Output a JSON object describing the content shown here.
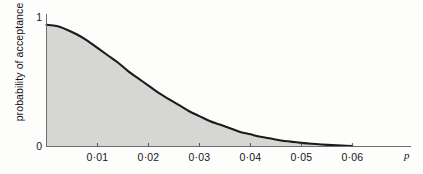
{
  "chart_data": {
    "type": "area",
    "title": "",
    "subtitle": "",
    "xlabel": "p",
    "ylabel": "probability of acceptance",
    "grid": false,
    "legend": null,
    "xlim": [
      0,
      0.0715
    ],
    "ylim": [
      0,
      1.06
    ],
    "x_tick_values": [
      0.01,
      0.02,
      0.03,
      0.04,
      0.05,
      0.06
    ],
    "x_tick_labels": [
      "0·01",
      "0·02",
      "0·03",
      "0·04",
      "0·05",
      "0·06"
    ],
    "y_tick_values": [
      0,
      1
    ],
    "y_tick_labels": [
      "0",
      "1"
    ],
    "series": [
      {
        "name": "probability of acceptance",
        "filled": true,
        "fill_color": "#d6d6d4",
        "line_color": "#1b1b1b",
        "x": [
          0.0,
          0.002,
          0.004,
          0.006,
          0.008,
          0.01,
          0.012,
          0.014,
          0.016,
          0.018,
          0.02,
          0.022,
          0.024,
          0.026,
          0.028,
          0.03,
          0.032,
          0.034,
          0.036,
          0.038,
          0.04,
          0.042,
          0.044,
          0.046,
          0.048,
          0.05,
          0.052,
          0.054,
          0.056,
          0.058,
          0.06
        ],
        "y": [
          1.0,
          0.99,
          0.96,
          0.92,
          0.87,
          0.81,
          0.75,
          0.69,
          0.62,
          0.56,
          0.5,
          0.44,
          0.39,
          0.34,
          0.29,
          0.25,
          0.21,
          0.18,
          0.15,
          0.12,
          0.1,
          0.08,
          0.065,
          0.05,
          0.04,
          0.03,
          0.022,
          0.016,
          0.011,
          0.007,
          0.004
        ]
      }
    ],
    "annotations": []
  },
  "axes": {
    "x_axis_name": "p",
    "y_axis_name": "probability of acceptance"
  }
}
